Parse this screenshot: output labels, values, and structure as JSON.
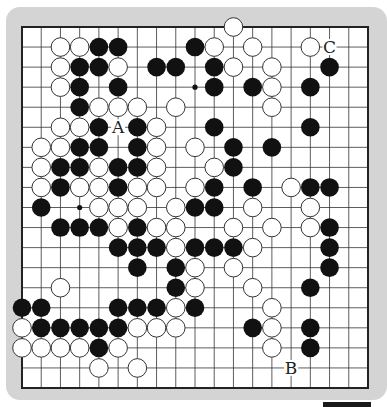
{
  "diagram": {
    "type": "go-board",
    "size": 19,
    "colors": {
      "frame": "#d4d4d4",
      "board": "#ffffff",
      "line": "#333333",
      "black_stone": "#111111",
      "white_stone": "#ffffff"
    },
    "star_points_visible": [
      [
        3,
        9
      ],
      [
        9,
        3
      ],
      [
        9,
        15
      ]
    ],
    "stones": {
      "white": [
        [
          0,
          11
        ],
        [
          1,
          2
        ],
        [
          1,
          3
        ],
        [
          1,
          10
        ],
        [
          1,
          12
        ],
        [
          1,
          15
        ],
        [
          2,
          2
        ],
        [
          2,
          5
        ],
        [
          2,
          11
        ],
        [
          2,
          13
        ],
        [
          3,
          2
        ],
        [
          3,
          13
        ],
        [
          4,
          4
        ],
        [
          4,
          5
        ],
        [
          4,
          6
        ],
        [
          4,
          8
        ],
        [
          4,
          13
        ],
        [
          5,
          2
        ],
        [
          5,
          3
        ],
        [
          5,
          7
        ],
        [
          6,
          1
        ],
        [
          6,
          2
        ],
        [
          6,
          7
        ],
        [
          6,
          9
        ],
        [
          7,
          1
        ],
        [
          7,
          4
        ],
        [
          7,
          7
        ],
        [
          7,
          10
        ],
        [
          8,
          1
        ],
        [
          8,
          3
        ],
        [
          8,
          4
        ],
        [
          8,
          6
        ],
        [
          8,
          7
        ],
        [
          8,
          9
        ],
        [
          8,
          14
        ],
        [
          9,
          4
        ],
        [
          9,
          5
        ],
        [
          9,
          6
        ],
        [
          9,
          8
        ],
        [
          9,
          12
        ],
        [
          9,
          15
        ],
        [
          10,
          5
        ],
        [
          10,
          7
        ],
        [
          10,
          8
        ],
        [
          10,
          11
        ],
        [
          10,
          13
        ],
        [
          10,
          15
        ],
        [
          11,
          8
        ],
        [
          11,
          12
        ],
        [
          12,
          9
        ],
        [
          12,
          11
        ],
        [
          13,
          2
        ],
        [
          13,
          9
        ],
        [
          13,
          12
        ],
        [
          14,
          8
        ],
        [
          14,
          13
        ],
        [
          15,
          0
        ],
        [
          15,
          6
        ],
        [
          15,
          7
        ],
        [
          15,
          8
        ],
        [
          15,
          13
        ],
        [
          16,
          0
        ],
        [
          16,
          1
        ],
        [
          16,
          2
        ],
        [
          16,
          3
        ],
        [
          16,
          5
        ],
        [
          16,
          13
        ],
        [
          17,
          4
        ],
        [
          17,
          6
        ]
      ],
      "black": [
        [
          1,
          4
        ],
        [
          1,
          5
        ],
        [
          1,
          9
        ],
        [
          2,
          3
        ],
        [
          2,
          4
        ],
        [
          2,
          7
        ],
        [
          2,
          8
        ],
        [
          2,
          10
        ],
        [
          2,
          16
        ],
        [
          3,
          3
        ],
        [
          3,
          5
        ],
        [
          3,
          10
        ],
        [
          3,
          12
        ],
        [
          3,
          15
        ],
        [
          4,
          3
        ],
        [
          5,
          4
        ],
        [
          5,
          6
        ],
        [
          5,
          10
        ],
        [
          5,
          15
        ],
        [
          6,
          3
        ],
        [
          6,
          4
        ],
        [
          6,
          6
        ],
        [
          6,
          11
        ],
        [
          6,
          13
        ],
        [
          7,
          2
        ],
        [
          7,
          3
        ],
        [
          7,
          5
        ],
        [
          7,
          6
        ],
        [
          7,
          11
        ],
        [
          8,
          2
        ],
        [
          8,
          5
        ],
        [
          8,
          10
        ],
        [
          8,
          12
        ],
        [
          8,
          15
        ],
        [
          8,
          16
        ],
        [
          9,
          1
        ],
        [
          9,
          9
        ],
        [
          9,
          10
        ],
        [
          10,
          2
        ],
        [
          10,
          3
        ],
        [
          10,
          4
        ],
        [
          10,
          6
        ],
        [
          10,
          16
        ],
        [
          11,
          5
        ],
        [
          11,
          6
        ],
        [
          11,
          7
        ],
        [
          11,
          9
        ],
        [
          11,
          10
        ],
        [
          11,
          11
        ],
        [
          11,
          16
        ],
        [
          12,
          6
        ],
        [
          12,
          8
        ],
        [
          12,
          16
        ],
        [
          13,
          8
        ],
        [
          13,
          15
        ],
        [
          14,
          0
        ],
        [
          14,
          1
        ],
        [
          14,
          5
        ],
        [
          14,
          6
        ],
        [
          14,
          7
        ],
        [
          14,
          9
        ],
        [
          15,
          1
        ],
        [
          15,
          2
        ],
        [
          15,
          3
        ],
        [
          15,
          4
        ],
        [
          15,
          5
        ],
        [
          15,
          12
        ],
        [
          15,
          15
        ],
        [
          16,
          4
        ],
        [
          16,
          15
        ]
      ]
    },
    "labels": [
      {
        "text": "A",
        "row": 5,
        "col": 5
      },
      {
        "text": "B",
        "row": 17,
        "col": 14
      },
      {
        "text": "C",
        "row": 1,
        "col": 16
      }
    ]
  }
}
